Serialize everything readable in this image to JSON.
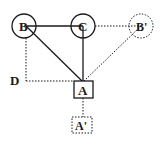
{
  "diagram": {
    "nodes": {
      "B": {
        "label": "B",
        "shape": "circle",
        "style": "solid"
      },
      "C": {
        "label": "C",
        "shape": "circle",
        "style": "solid"
      },
      "B_prime": {
        "label": "B'",
        "shape": "circle",
        "style": "dotted"
      },
      "A": {
        "label": "A",
        "shape": "square",
        "style": "solid"
      },
      "A_prime": {
        "label": "A'",
        "shape": "square",
        "style": "dotted"
      },
      "D": {
        "label": "D",
        "shape": "point-label",
        "style": "none"
      }
    },
    "edges": [
      {
        "from": "B",
        "to": "C",
        "style": "solid"
      },
      {
        "from": "C",
        "to": "B'",
        "style": "dotted"
      },
      {
        "from": "B",
        "to": "A",
        "style": "solid"
      },
      {
        "from": "C",
        "to": "A",
        "style": "solid"
      },
      {
        "from": "B'",
        "to": "A",
        "style": "dotted"
      },
      {
        "from": "B",
        "to": "D",
        "style": "dotted"
      },
      {
        "from": "D",
        "to": "A",
        "style": "dotted"
      },
      {
        "from": "A",
        "to": "A'",
        "style": "dotted"
      }
    ],
    "colors": {
      "ink": "#1a1a1a",
      "background": "#ffffff"
    }
  }
}
